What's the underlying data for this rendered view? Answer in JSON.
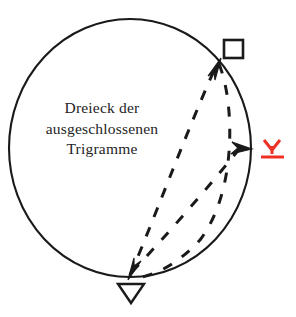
{
  "figure": {
    "title_lines": [
      "Dreieck der",
      "ausgeschlossenen",
      "Trigramme"
    ],
    "line1": "Dreieck der",
    "line2": "ausgeschlossenen",
    "line3": "Trigramme",
    "colors": {
      "stroke": "#1a1a1a",
      "text": "#242424",
      "accent_red": "#ef3124",
      "background": "#ffffff"
    },
    "circle": {
      "center_x": 130,
      "center_y": 148,
      "radius_x": 121,
      "radius_y": 129,
      "stroke_width": 2.0
    },
    "markers": [
      {
        "id": "square-marker",
        "glyph": "square",
        "label": "",
        "x": 233,
        "y": 49,
        "color": "#1a1a1a"
      },
      {
        "id": "red-marker",
        "glyph": "y-underline",
        "label": "",
        "x": 272,
        "y": 148,
        "color": "#ef3124"
      },
      {
        "id": "triangle-marker",
        "glyph": "triangle-down",
        "label": "",
        "x": 131,
        "y": 293,
        "color": "#1a1a1a"
      }
    ],
    "dashed_edges": [
      {
        "id": "edge-bottom-to-square",
        "from": "triangle-marker",
        "to": "square-marker",
        "arrow": "to-square"
      },
      {
        "id": "edge-bottom-to-red",
        "from": "triangle-marker",
        "to": "red-marker",
        "arrow": "to-red"
      },
      {
        "id": "edge-square-to-bottom",
        "from": "square-marker",
        "to": "triangle-marker",
        "arrow": "to-triangle"
      }
    ]
  }
}
